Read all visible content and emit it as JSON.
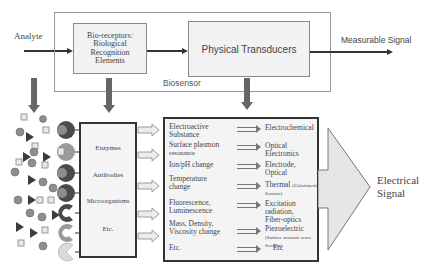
{
  "top": {
    "analyte_label": "Analyte",
    "biosensor_label": "Biosensor",
    "bioreceptor_box": {
      "lines": [
        "Bio-receptors:",
        "Biological",
        "Recognition",
        "Elements"
      ]
    },
    "transducer_box": {
      "label": "Physical Transducers"
    },
    "output_label": "Measurable Signal"
  },
  "receptors": {
    "items": [
      "Enzymes",
      "Antibodies",
      "Microorganisms",
      "Etc."
    ]
  },
  "transducers": {
    "rows": [
      {
        "input": [
          "Electroactive",
          "Substance"
        ],
        "output": [
          "Electrochemical"
        ],
        "output_small": ""
      },
      {
        "input": [
          "Surface plasmon",
          "resonance"
        ],
        "output": [
          "Optical Electronics"
        ],
        "output_small": ""
      },
      {
        "input": [
          "Ion/pH change"
        ],
        "output": [
          "Electrode, Optical"
        ],
        "output_small": ""
      },
      {
        "input": [
          "Temperature",
          "change"
        ],
        "output": [
          "Thermal"
        ],
        "output_small": "(Calorimetric Sensors)"
      },
      {
        "input": [
          "Fluorescence,",
          "Luminescence"
        ],
        "output": [
          "Excitation radiation,",
          "Fiber-optics"
        ],
        "output_small": ""
      },
      {
        "input": [
          "Mass, Density,",
          "Viscosity change"
        ],
        "output": [
          "Piezoelectric"
        ],
        "output_small": "(Surface acoustic wave Sensors)"
      },
      {
        "input": [
          "Etc."
        ],
        "output": [
          "Etc"
        ],
        "output_small": ""
      }
    ]
  },
  "result": {
    "lines": [
      "Electrical",
      "Signal"
    ]
  },
  "colors": {
    "dark_shape": "#4a4a4a",
    "mid_shape": "#8c8c8c",
    "light_shape": "#cfcfcf",
    "box_fill": "#f2f2f2",
    "arrow_fill": "#e6e6e6"
  }
}
